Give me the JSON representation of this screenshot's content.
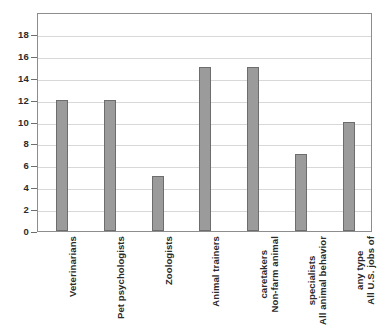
{
  "chart_data": {
    "type": "bar",
    "title": "",
    "subtitle": "",
    "xlabel": "",
    "ylabel": "",
    "ylim": [
      0,
      20
    ],
    "ytick_step": 2,
    "grid": true,
    "legend": "none",
    "orientation": "vertical",
    "bar_color": "#9b9b9b",
    "bar_border_color": "#6d6d6d",
    "grid_color": "#d8d8d8",
    "frame_color": "#8d8d8d",
    "axis_tick_labels": [
      "0",
      "2",
      "4",
      "6",
      "8",
      "10",
      "12",
      "14",
      "16",
      "18"
    ],
    "categories": [
      "Veterinarians",
      "Pet psychologists",
      "Zoologists",
      "Animal trainers",
      "Non-farm animal caretakers",
      "All animal behavior specialists",
      "All U.S. jobs of any type"
    ],
    "category_label_lines": [
      [
        "Veterinarians"
      ],
      [
        "Pet psychologists"
      ],
      [
        "Zoologists"
      ],
      [
        "Animal trainers"
      ],
      [
        "Non-farm animal",
        "caretakers"
      ],
      [
        "All animal behavior",
        "specialists"
      ],
      [
        "All U.S. jobs of",
        "any type"
      ]
    ],
    "values": [
      12,
      12,
      5,
      15,
      15,
      7,
      10
    ]
  }
}
